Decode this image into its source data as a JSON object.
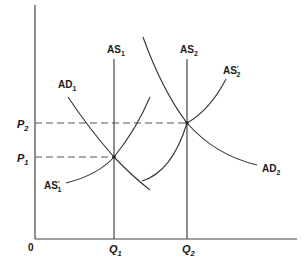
{
  "diagram": {
    "type": "economics-ad-as",
    "origin_label": "0",
    "y_axis": {
      "ticks": [
        {
          "name": "P",
          "sub": "2",
          "level": "upper"
        },
        {
          "name": "P",
          "sub": "1",
          "level": "lower"
        }
      ]
    },
    "x_axis": {
      "ticks": [
        {
          "name": "Q",
          "sub": "1"
        },
        {
          "name": "Q",
          "sub": "2"
        }
      ]
    },
    "curves": {
      "as1": {
        "base": "AS",
        "sub": "1",
        "prime": false,
        "kind": "vertical"
      },
      "as2": {
        "base": "AS",
        "sub": "2",
        "prime": false,
        "kind": "vertical"
      },
      "ad1": {
        "base": "AD",
        "sub": "1",
        "prime": false,
        "kind": "downward"
      },
      "ad2": {
        "base": "AD",
        "sub": "2",
        "prime": false,
        "kind": "downward"
      },
      "as1p": {
        "base": "AS",
        "sub": "1",
        "prime": true,
        "prime_mark": "'",
        "kind": "upward"
      },
      "as2p": {
        "base": "AS",
        "sub": "2",
        "prime": true,
        "prime_mark": "'",
        "kind": "upward"
      }
    },
    "equilibria": [
      {
        "price": "P1",
        "quantity": "Q1"
      },
      {
        "price": "P2",
        "quantity": "Q2"
      }
    ],
    "colors": {
      "line": "#333333",
      "text": "#1a1a1a",
      "background": "#ffffff"
    }
  }
}
